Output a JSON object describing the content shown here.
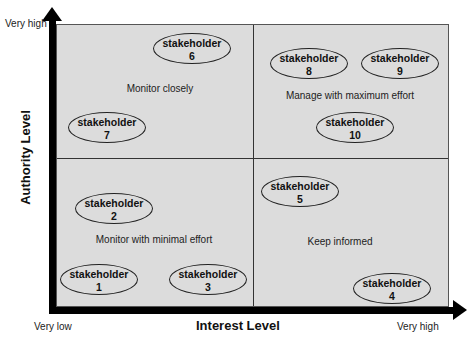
{
  "axes": {
    "y_title": "Authority Level",
    "x_title": "Interest Level",
    "y_high": "Very high",
    "x_low": "Very low",
    "x_high": "Very high"
  },
  "quadrants": [
    {
      "id": "top-left",
      "label": "Monitor closely"
    },
    {
      "id": "top-right",
      "label": "Manage with maximum effort"
    },
    {
      "id": "bottom-left",
      "label": "Monitor with minimal effort"
    },
    {
      "id": "bottom-right",
      "label": "Keep informed"
    }
  ],
  "stakeholders": [
    {
      "text": "stakeholder",
      "number": "1"
    },
    {
      "text": "stakeholder",
      "number": "2"
    },
    {
      "text": "stakeholder",
      "number": "3"
    },
    {
      "text": "stakeholder",
      "number": "4"
    },
    {
      "text": "stakeholder",
      "number": "5"
    },
    {
      "text": "stakeholder",
      "number": "6"
    },
    {
      "text": "stakeholder",
      "number": "7"
    },
    {
      "text": "stakeholder",
      "number": "8"
    },
    {
      "text": "stakeholder",
      "number": "9"
    },
    {
      "text": "stakeholder",
      "number": "10"
    }
  ]
}
